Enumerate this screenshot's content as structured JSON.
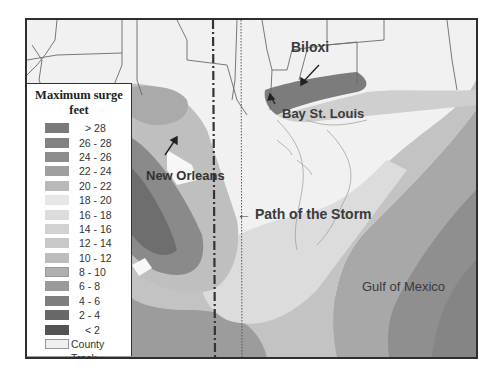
{
  "map": {
    "title": "Maximum surge",
    "units": "feet",
    "labels": {
      "biloxi": "Biloxi",
      "bay_st_louis": "Bay St. Louis",
      "new_orleans": "New Orleans",
      "path": "← Path of the Storm",
      "gulf": "Gulf of Mexico"
    },
    "legend": {
      "title_line1": "Maximum surge",
      "title_line2": "feet",
      "classes": [
        {
          "label": "> 28",
          "color": "#7a7a7a"
        },
        {
          "label": "26 - 28",
          "color": "#828282"
        },
        {
          "label": "24 - 26",
          "color": "#8c8c8c"
        },
        {
          "label": "22 - 24",
          "color": "#9f9f9f"
        },
        {
          "label": "20 - 22",
          "color": "#b9b9b9"
        },
        {
          "label": "18 - 20",
          "color": "#e6e6e6"
        },
        {
          "label": "16 - 18",
          "color": "#dcdcdc"
        },
        {
          "label": "14 - 16",
          "color": "#d2d2d2"
        },
        {
          "label": "12 - 14",
          "color": "#c8c8c8"
        },
        {
          "label": "10 - 12",
          "color": "#bdbdbd"
        },
        {
          "label": "8 - 10",
          "color": "#b0b0b0"
        },
        {
          "label": "6 - 8",
          "color": "#9a9a9a"
        },
        {
          "label": "4 - 6",
          "color": "#7e7e7e"
        },
        {
          "label": "2 - 4",
          "color": "#686868"
        },
        {
          "label": "< 2",
          "color": "#545454"
        }
      ],
      "county_label": "County",
      "track_label": "Track"
    }
  }
}
